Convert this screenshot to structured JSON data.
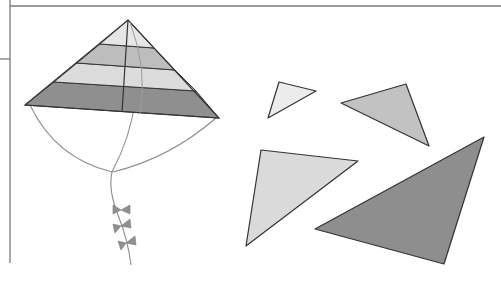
{
  "figure": {
    "colors": {
      "frame_line": "#7a7a7a",
      "outline": "#333333",
      "string": "#8c8c8c",
      "band_1": "#e6e6e6",
      "band_2": "#bdbdbd",
      "band_3": "#dcdcdc",
      "band_4": "#8f8f8f",
      "triangle_1": "#ececec",
      "triangle_2": "#c2c2c2",
      "triangle_3": "#dadada",
      "triangle_4": "#8e8e8e",
      "bow": "#8f8f8f"
    },
    "kite": {
      "apex": [
        128,
        20
      ],
      "left_corner": [
        25,
        105
      ],
      "right_corner": [
        219,
        118
      ],
      "spar_bottom": [
        122,
        112
      ],
      "bridle_knot": [
        112,
        172
      ],
      "tail_end": [
        131,
        265
      ],
      "bands": 4,
      "bows": 3
    },
    "triangles": [
      {
        "id": 1,
        "points": "279,82 316,91 268,118",
        "shade": "lightest"
      },
      {
        "id": 2,
        "points": "341,103 406,84 429,146",
        "shade": "medium-light"
      },
      {
        "id": 3,
        "points": "261,150 358,161 246,246",
        "shade": "light"
      },
      {
        "id": 4,
        "points": "484,137 315,229 444,264",
        "shade": "dark"
      }
    ]
  }
}
